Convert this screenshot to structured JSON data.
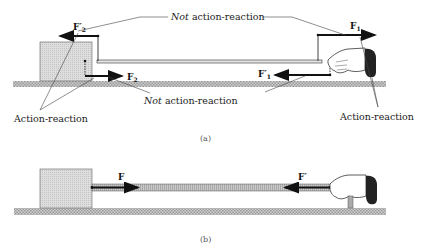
{
  "panel_a": {
    "caption": "(a)",
    "forces": {
      "F2_prime": "F′",
      "F2_prime_sub": "2",
      "F2": "F",
      "F2_sub": "2",
      "F1": "F",
      "F1_sub": "1",
      "F1_prime": "F′",
      "F1_prime_sub": "1"
    },
    "labels": {
      "not_ar_top_italic": "Not",
      "not_ar_top_rest": " action-reaction",
      "not_ar_bottom_italic": "Not",
      "not_ar_bottom_rest": " action-reaction",
      "ar_left": "Action-reaction",
      "ar_right": "Action-reaction"
    }
  },
  "panel_b": {
    "caption": "(b)",
    "forces": {
      "F": "F",
      "F_prime": "F′"
    }
  },
  "colors": {
    "ink": "#111111",
    "block_fill": "#d8d8d8",
    "ground_fill": "#bdbdbd",
    "rope_fill": "#bbbbbb",
    "glove": "#222222"
  }
}
